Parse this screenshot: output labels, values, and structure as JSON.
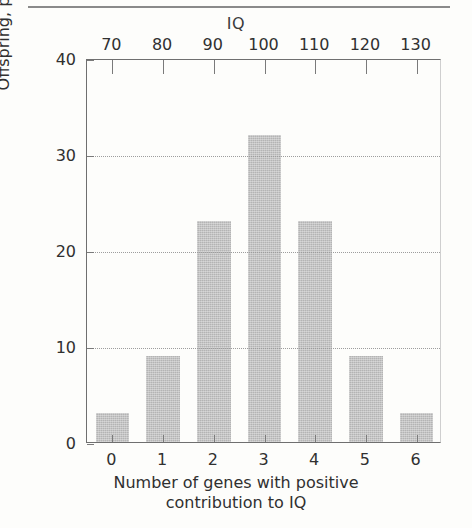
{
  "chart_data": {
    "type": "bar",
    "title": "",
    "categories": [
      "0",
      "1",
      "2",
      "3",
      "4",
      "5",
      "6"
    ],
    "values": [
      3,
      9,
      23,
      32,
      23,
      9,
      3
    ],
    "xlabel_line1": "Number of genes with positive",
    "xlabel_line2": "contribution to IQ",
    "ylabel": "Offspring, percent",
    "ylim": [
      0,
      40
    ],
    "yticks": [
      "0",
      "10",
      "20",
      "30",
      "40"
    ],
    "ytick_values": [
      0,
      10,
      20,
      30,
      40
    ],
    "gridlines": [
      10,
      20,
      30
    ],
    "grid": true,
    "legend": "none",
    "secondary_axis": {
      "position": "top",
      "title": "IQ",
      "ticks": [
        "70",
        "80",
        "90",
        "100",
        "110",
        "120",
        "130"
      ],
      "tick_values": [
        70,
        80,
        90,
        100,
        110,
        120,
        130
      ]
    },
    "bar_color": "#b4b4b4",
    "axis_color": "#6f6f6f",
    "grid_color": "#9d9d9d",
    "background_color": "#fdfdfb"
  }
}
